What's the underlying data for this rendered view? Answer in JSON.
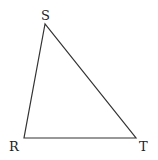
{
  "diagram": {
    "type": "triangle",
    "vertices": [
      {
        "label": "S",
        "x": 45,
        "y": 24,
        "label_x": 41,
        "label_y": 20
      },
      {
        "label": "R",
        "x": 24,
        "y": 138,
        "label_x": 9,
        "label_y": 151
      },
      {
        "label": "T",
        "x": 136,
        "y": 138,
        "label_x": 139,
        "label_y": 151
      }
    ],
    "stroke_color": "#333333",
    "background": "#ffffff"
  }
}
